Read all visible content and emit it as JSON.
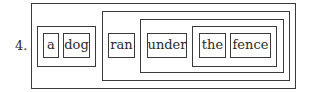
{
  "diagram": {
    "item_number": "4.",
    "sentence": "a dog ran under the fence",
    "constituents": {
      "sentence": {
        "label": "S",
        "children": [
          "np_subject",
          "vp"
        ]
      },
      "np_subject": {
        "words": [
          "a",
          "dog"
        ]
      },
      "vp": {
        "words": [
          "ran"
        ],
        "children": [
          "pp"
        ]
      },
      "pp": {
        "words": [
          "under"
        ],
        "children": [
          "np_object"
        ]
      },
      "np_object": {
        "words": [
          "the",
          "fence"
        ]
      }
    },
    "words": [
      {
        "text": "a"
      },
      {
        "text": "dog"
      },
      {
        "text": "ran"
      },
      {
        "text": "under"
      },
      {
        "text": "the"
      },
      {
        "text": "fence"
      }
    ],
    "colors": {
      "line": "#3a3a3a",
      "text": "#2a2a2a",
      "background": "#ffffff"
    }
  }
}
